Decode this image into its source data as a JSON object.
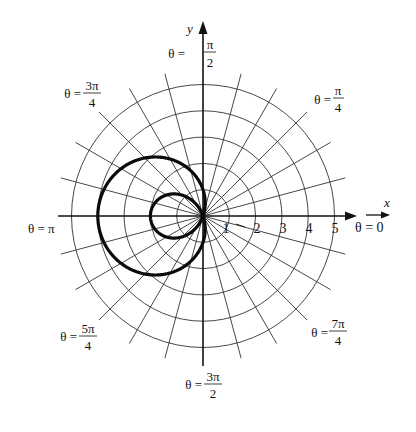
{
  "chart_data": {
    "type": "line",
    "subtype": "polar",
    "title": "",
    "equation": "r = 1 - 3cos(θ)",
    "curve": "limaçon with inner loop",
    "xlabel": "x",
    "ylabel": "y",
    "radial_ticks": [
      "1",
      "2",
      "3",
      "4",
      "5"
    ],
    "radial_range": [
      0,
      5
    ],
    "grid": {
      "circles": [
        1,
        2,
        3,
        4,
        5
      ],
      "ray_step_degrees": 15
    },
    "angle_labels": [
      {
        "id": "zero",
        "text": "θ = 0",
        "num": "",
        "den": ""
      },
      {
        "id": "pi4",
        "text": "θ =",
        "num": "π",
        "den": "4"
      },
      {
        "id": "pi2",
        "text": "θ =",
        "num": "π",
        "den": "2"
      },
      {
        "id": "3pi4",
        "text": "θ =",
        "num": "3π",
        "den": "4"
      },
      {
        "id": "pi",
        "text": "θ = π",
        "num": "",
        "den": ""
      },
      {
        "id": "5pi4",
        "text": "θ =",
        "num": "5π",
        "den": "4"
      },
      {
        "id": "3pi2",
        "text": "θ =",
        "num": "3π",
        "den": "2"
      },
      {
        "id": "7pi4",
        "text": "θ =",
        "num": "7π",
        "den": "4"
      }
    ],
    "key_points": [
      {
        "theta": "0",
        "r": -2,
        "x": -2,
        "y": 0
      },
      {
        "theta": "π/2",
        "r": 1,
        "x": 0,
        "y": 1
      },
      {
        "theta": "π",
        "r": 4,
        "x": -4,
        "y": 0
      },
      {
        "theta": "3π/2",
        "r": 1,
        "x": 0,
        "y": -1
      }
    ]
  },
  "layout": {
    "cx": 203,
    "cy": 216,
    "unit": 26.3,
    "ray_length": 5.6,
    "colors": {
      "ink": "#111111",
      "grid": "#333333",
      "background": "#ffffff"
    }
  }
}
